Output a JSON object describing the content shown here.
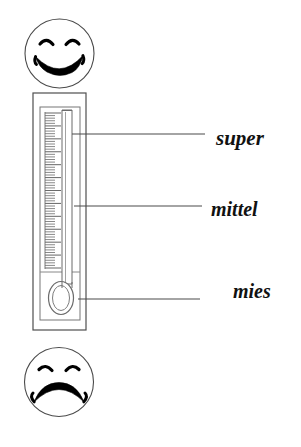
{
  "page": {
    "width": 301,
    "height": 447,
    "background_color": "#ffffff",
    "ink_color": "#000000",
    "line_color": "#555555"
  },
  "figure": {
    "type": "mood-thermometer-diagram"
  },
  "faces": [
    {
      "name": "happy-face",
      "mood": "happy",
      "position": "top",
      "cx": 59.5,
      "cy": 53.5,
      "r": 34.5
    },
    {
      "name": "sad-face",
      "mood": "sad",
      "position": "bottom",
      "cx": 59,
      "cy": 382,
      "r": 34.5
    }
  ],
  "thermometer": {
    "name": "thermometer",
    "outer_frame": {
      "x": 33,
      "y": 93,
      "width": 53,
      "height": 237
    },
    "inner_frame": {
      "x": 40,
      "y": 107,
      "width": 40,
      "height": 213
    },
    "scale": {
      "minor_ticks": 60,
      "major_tick_every": 5,
      "top": 113,
      "bottom": 268
    },
    "capillary": {
      "x": 62,
      "y": 110,
      "width": 10,
      "height": 172
    },
    "bulb": {
      "cx": 61,
      "cy": 298,
      "rx": 12,
      "ry": 16
    }
  },
  "labels": [
    {
      "id": "super",
      "text": "super",
      "leader_line": {
        "x1": 72,
        "y1": 134,
        "x2": 205,
        "y2": 134
      }
    },
    {
      "id": "mittel",
      "text": "mittel",
      "leader_line": {
        "x1": 74,
        "y1": 206,
        "x2": 202,
        "y2": 206
      }
    },
    {
      "id": "mies",
      "text": "mies",
      "leader_line": {
        "x1": 78,
        "y1": 299,
        "x2": 200,
        "y2": 299
      }
    }
  ]
}
